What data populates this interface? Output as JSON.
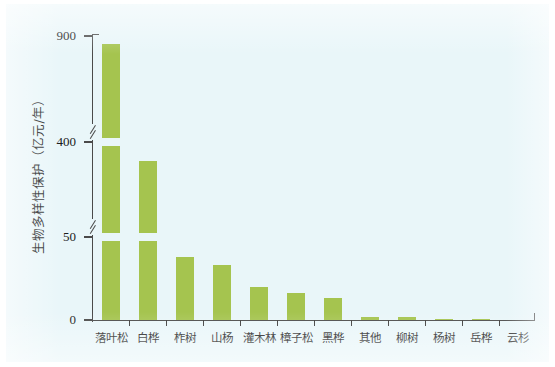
{
  "chart_data": {
    "type": "bar",
    "title": "",
    "subtitle": "",
    "xlabel": "",
    "ylabel": "生物多样性保护（亿元/年）",
    "categories": [
      "落叶松",
      "白桦",
      "柞树",
      "山杨",
      "灌木林",
      "樟子松",
      "黑桦",
      "其他",
      "柳树",
      "杨树",
      "岳桦",
      "云杉"
    ],
    "values": [
      860,
      330,
      38,
      33,
      20,
      16,
      13,
      2.0,
      1.6,
      0.7,
      0.4,
      0
    ],
    "series": [
      {
        "name": "生物多样性保护",
        "values": [
          860,
          330,
          38,
          33,
          20,
          16,
          13,
          2.0,
          1.6,
          0.7,
          0.4,
          0
        ]
      }
    ],
    "ytick_labels": [
      "0",
      "50",
      "400",
      "900"
    ],
    "ytick_values": [
      0,
      50,
      400,
      900
    ],
    "ylim": [
      0,
      900
    ],
    "axis_breaks": [
      {
        "from": 50,
        "to": 400
      },
      {
        "from": 400,
        "to": 900
      }
    ],
    "grid": false,
    "legend": false,
    "legend_position": "none",
    "bar_color": "#a5c44f",
    "axis_color": "#4a4a4a",
    "background_color": "#e9f6f9",
    "annotations": []
  },
  "axis": {
    "y_title": "生物多样性保护（亿元/年）",
    "ticks": [
      {
        "label": "900"
      },
      {
        "label": "400"
      },
      {
        "label": "50"
      },
      {
        "label": "0"
      }
    ]
  }
}
